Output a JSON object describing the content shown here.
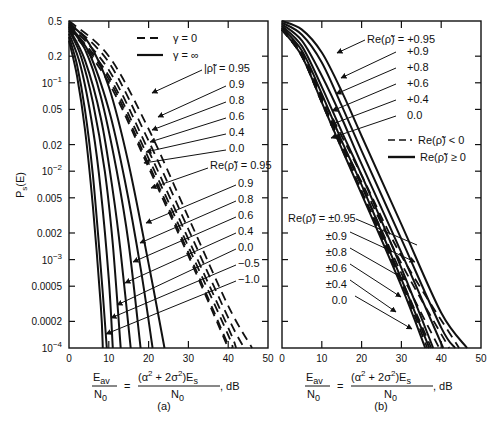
{
  "chart_data": [
    {
      "panel": "(a)",
      "type": "line",
      "title": "",
      "xlabel": "E_av/N_0 = (α² + 2σ²)E_s/N_0, dB",
      "ylabel": "P_s(E)",
      "xlim": [
        0,
        50
      ],
      "ylim": [
        0.0001,
        0.5
      ],
      "yscale": "log",
      "xticks": [
        0,
        10,
        20,
        30,
        40,
        50
      ],
      "yticks": [
        "0.5",
        "0.2",
        "10^-1",
        "0.05",
        "0.02",
        "10^-2",
        "0.005",
        "0.002",
        "10^-3",
        "0.0005",
        "0.0002",
        "10^-4"
      ],
      "grid": false,
      "legend": [
        {
          "style": "dashed",
          "label": "γ = 0"
        },
        {
          "style": "solid",
          "label": "γ = ∞"
        }
      ],
      "annotation_groups": [
        {
          "parameter": "|ρ̃|",
          "applies_to": "γ = 0 (dashed)",
          "values": [
            "0.95",
            "0.9",
            "0.8",
            "0.6",
            "0.4",
            "0.0"
          ]
        },
        {
          "parameter": "Re(ρ̃)",
          "applies_to": "γ = ∞ (solid)",
          "values": [
            "0.95",
            "0.9",
            "0.8",
            "0.6",
            "0.4",
            "0.0",
            "-0.5",
            "-1.0"
          ]
        }
      ],
      "series": [
        {
          "name": "γ=∞, Re(ρ̃)=0.95",
          "style": "solid",
          "x": [
            0,
            2,
            4,
            6,
            8,
            8.5
          ],
          "y": [
            0.3,
            0.12,
            0.03,
            0.004,
            0.0003,
            0.0001
          ]
        },
        {
          "name": "γ=∞, Re(ρ̃)=0.9",
          "style": "solid",
          "x": [
            0,
            2,
            4,
            6,
            8,
            9.5
          ],
          "y": [
            0.33,
            0.16,
            0.05,
            0.009,
            0.0008,
            0.0001
          ]
        },
        {
          "name": "γ=∞, Re(ρ̃)=0.8",
          "style": "solid",
          "x": [
            0,
            3,
            6,
            8,
            10,
            11
          ],
          "y": [
            0.36,
            0.15,
            0.03,
            0.006,
            0.0006,
            0.0001
          ]
        },
        {
          "name": "γ=∞, Re(ρ̃)=0.6",
          "style": "solid",
          "x": [
            0,
            3,
            6,
            9,
            11,
            13
          ],
          "y": [
            0.39,
            0.2,
            0.06,
            0.01,
            0.0015,
            0.0001
          ]
        },
        {
          "name": "γ=∞, Re(ρ̃)=0.4",
          "style": "solid",
          "x": [
            0,
            4,
            8,
            11,
            13,
            15.5
          ],
          "y": [
            0.41,
            0.18,
            0.04,
            0.006,
            0.0012,
            0.0001
          ]
        },
        {
          "name": "γ=∞, Re(ρ̃)=0.0",
          "style": "solid",
          "x": [
            0,
            4,
            8,
            12,
            15,
            18
          ],
          "y": [
            0.43,
            0.24,
            0.07,
            0.01,
            0.0015,
            0.0001
          ]
        },
        {
          "name": "γ=∞, Re(ρ̃)=-0.5",
          "style": "solid",
          "x": [
            0,
            5,
            10,
            14,
            18,
            21
          ],
          "y": [
            0.45,
            0.22,
            0.05,
            0.008,
            0.0008,
            0.0001
          ]
        },
        {
          "name": "γ=∞, Re(ρ̃)=-1.0",
          "style": "solid",
          "x": [
            0,
            5,
            10,
            15,
            20,
            24
          ],
          "y": [
            0.47,
            0.28,
            0.09,
            0.012,
            0.0009,
            0.0001
          ]
        },
        {
          "name": "γ=0, |ρ̃|=0.95",
          "style": "dashed",
          "x": [
            0,
            10,
            20,
            30,
            40,
            46
          ],
          "y": [
            0.5,
            0.2,
            0.03,
            0.003,
            0.0003,
            0.0001
          ]
        },
        {
          "name": "γ=0, |ρ̃|=0.9",
          "style": "dashed",
          "x": [
            0,
            10,
            20,
            30,
            40,
            44
          ],
          "y": [
            0.48,
            0.17,
            0.022,
            0.0022,
            0.00022,
            0.0001
          ]
        },
        {
          "name": "γ=0, |ρ̃|=0.8",
          "style": "dashed",
          "x": [
            0,
            10,
            20,
            30,
            40,
            42
          ],
          "y": [
            0.46,
            0.14,
            0.017,
            0.0017,
            0.00017,
            0.0001
          ]
        },
        {
          "name": "γ=0, |ρ̃|=0.6",
          "style": "dashed",
          "x": [
            0,
            10,
            20,
            30,
            40,
            41
          ],
          "y": [
            0.44,
            0.12,
            0.014,
            0.0014,
            0.00014,
            0.0001
          ]
        },
        {
          "name": "γ=0, |ρ̃|=0.4",
          "style": "dashed",
          "x": [
            0,
            10,
            20,
            30,
            40.3
          ],
          "y": [
            0.43,
            0.11,
            0.012,
            0.0012,
            0.0001
          ]
        },
        {
          "name": "γ=0, |ρ̃|=0.0",
          "style": "dashed",
          "x": [
            0,
            10,
            20,
            30,
            40
          ],
          "y": [
            0.42,
            0.1,
            0.011,
            0.0011,
            0.0001
          ]
        }
      ]
    },
    {
      "panel": "(b)",
      "type": "line",
      "title": "",
      "xlabel": "E_av/N_0 = (α² + 2σ²)E_s/N_0, dB",
      "ylabel": "P_s(E)",
      "xlim": [
        0,
        50
      ],
      "ylim": [
        0.0001,
        0.5
      ],
      "yscale": "log",
      "xticks": [
        0,
        10,
        20,
        30,
        40,
        50
      ],
      "grid": false,
      "legend": [
        {
          "style": "dashed",
          "label": "Re(ρ̃) < 0"
        },
        {
          "style": "solid",
          "label": "Re(ρ̃) ≥ 0"
        }
      ],
      "annotation_groups": [
        {
          "parameter": "Re(ρ̃)",
          "region": "top",
          "values": [
            "+0.95",
            "+0.9",
            "+0.8",
            "+0.6",
            "+0.4",
            "0.0"
          ]
        },
        {
          "parameter": "Re(ρ̃)",
          "region": "bottom",
          "values": [
            "±0.95",
            "±0.9",
            "±0.8",
            "±0.6",
            "±0.4",
            "0.0"
          ]
        }
      ],
      "series": [
        {
          "name": "Re(ρ̃)=+0.95",
          "style": "solid",
          "x": [
            0,
            5,
            10,
            15,
            20,
            30,
            40,
            46.5
          ],
          "y": [
            0.5,
            0.4,
            0.22,
            0.08,
            0.025,
            0.0025,
            0.00025,
            0.0001
          ]
        },
        {
          "name": "Re(ρ̃)=+0.9",
          "style": "solid",
          "x": [
            0,
            5,
            10,
            15,
            20,
            30,
            40,
            43.5
          ],
          "y": [
            0.48,
            0.35,
            0.17,
            0.055,
            0.017,
            0.0017,
            0.00017,
            0.0001
          ]
        },
        {
          "name": "Re(ρ̃)=+0.8",
          "style": "solid",
          "x": [
            0,
            5,
            10,
            15,
            20,
            30,
            40.5
          ],
          "y": [
            0.46,
            0.3,
            0.12,
            0.04,
            0.012,
            0.0012,
            0.0001
          ]
        },
        {
          "name": "Re(ρ̃)=+0.6",
          "style": "solid",
          "x": [
            0,
            5,
            10,
            15,
            20,
            30,
            38
          ],
          "y": [
            0.44,
            0.26,
            0.09,
            0.028,
            0.009,
            0.0008,
            0.0001
          ]
        },
        {
          "name": "Re(ρ̃)=+0.4",
          "style": "solid",
          "x": [
            0,
            5,
            10,
            15,
            20,
            30,
            37
          ],
          "y": [
            0.42,
            0.23,
            0.075,
            0.022,
            0.007,
            0.0006,
            0.0001
          ]
        },
        {
          "name": "Re(ρ̃)=0.0",
          "style": "solid",
          "x": [
            0,
            5,
            10,
            15,
            20,
            30,
            36
          ],
          "y": [
            0.4,
            0.2,
            0.06,
            0.018,
            0.0055,
            0.0005,
            0.0001
          ]
        },
        {
          "name": "Re(ρ̃)=-0.95",
          "style": "dashed",
          "x": [
            0,
            5,
            10,
            15,
            20,
            30,
            44.5
          ],
          "y": [
            0.42,
            0.22,
            0.07,
            0.025,
            0.009,
            0.0011,
            0.0001
          ]
        },
        {
          "name": "Re(ρ̃)=-0.9",
          "style": "dashed",
          "x": [
            0,
            5,
            10,
            15,
            20,
            30,
            42
          ],
          "y": [
            0.41,
            0.21,
            0.065,
            0.021,
            0.0075,
            0.0009,
            0.0001
          ]
        },
        {
          "name": "Re(ρ̃)=-0.8",
          "style": "dashed",
          "x": [
            0,
            5,
            10,
            15,
            20,
            30,
            39.5
          ],
          "y": [
            0.4,
            0.2,
            0.062,
            0.02,
            0.0068,
            0.0007,
            0.0001
          ]
        },
        {
          "name": "Re(ρ̃)=-0.6",
          "style": "dashed",
          "x": [
            0,
            5,
            10,
            15,
            20,
            30,
            37.5
          ],
          "y": [
            0.4,
            0.2,
            0.06,
            0.019,
            0.006,
            0.0006,
            0.0001
          ]
        },
        {
          "name": "Re(ρ̃)=-0.4",
          "style": "dashed",
          "x": [
            0,
            5,
            10,
            15,
            20,
            30,
            36.5
          ],
          "y": [
            0.4,
            0.2,
            0.06,
            0.018,
            0.0058,
            0.00055,
            0.0001
          ]
        }
      ]
    }
  ],
  "figure": {
    "ylabel": "P",
    "ylabel_sub": "s",
    "ylabel_tail": "(E)",
    "ytick_labels": [
      {
        "text": "0.5",
        "sup": ""
      },
      {
        "text": "0.2",
        "sup": ""
      },
      {
        "text": "10",
        "sup": "−1"
      },
      {
        "text": "0.05",
        "sup": ""
      },
      {
        "text": "0.02",
        "sup": ""
      },
      {
        "text": "10",
        "sup": "−2"
      },
      {
        "text": "0.005",
        "sup": ""
      },
      {
        "text": "0.002",
        "sup": ""
      },
      {
        "text": "10",
        "sup": "−3"
      },
      {
        "text": "0.0005",
        "sup": ""
      },
      {
        "text": "0.0002",
        "sup": ""
      },
      {
        "text": "10",
        "sup": "−4"
      }
    ],
    "xtick_labels": [
      "0",
      "10",
      "20",
      "30",
      "40",
      "50"
    ],
    "xlabel": {
      "lhs_num": "E",
      "lhs_num_sub": "av",
      "lhs_den": "N",
      "lhs_den_sub": "0",
      "eq": "=",
      "rhs_num": "(α  + 2σ )E",
      "rhs_num_sup1": "2",
      "rhs_num_sup2": "2",
      "rhs_num_sub": "s",
      "rhs_den": "N",
      "rhs_den_sub": "0",
      "unit": ", dB"
    },
    "panel_a": {
      "caption": "(a)",
      "legend_dashed": "γ = 0",
      "legend_solid": "γ = ∞",
      "group1_header": "|ρ̃| = 0.95",
      "group1_values": [
        "0.9",
        "0.8",
        "0.6",
        "0.4",
        "0.0"
      ],
      "group2_header": "Re(ρ̃) = 0.95",
      "group2_values": [
        "0.9",
        "0.8",
        "0.6",
        "0.4",
        "0.0",
        "−0.5",
        "−1.0"
      ]
    },
    "panel_b": {
      "caption": "(b)",
      "top_header": "Re(ρ̃) = +0.95",
      "top_values": [
        "+0.9",
        "+0.8",
        "+0.6",
        "+0.4",
        "0.0"
      ],
      "legend_dashed": "Re(ρ̃)  < 0",
      "legend_solid": "Re(ρ̃)  ≥ 0",
      "bottom_header": "Re(ρ̃) = ±0.95",
      "bottom_values": [
        "±0.9",
        "±0.8",
        "±0.6",
        "±0.4",
        "0.0"
      ]
    }
  }
}
